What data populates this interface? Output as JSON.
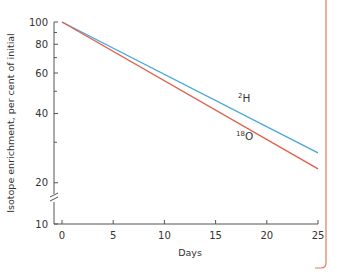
{
  "chart_data": {
    "type": "line",
    "title": "",
    "xlabel": "Days",
    "ylabel": "Isotope enrichment, per cent of initial",
    "x_scale": "linear",
    "y_scale": "log",
    "xlim": [
      0,
      25
    ],
    "ylim": [
      10,
      100
    ],
    "xticks": [
      0,
      5,
      10,
      15,
      20,
      25
    ],
    "yticks_labeled": [
      10,
      20,
      40,
      60,
      80,
      100
    ],
    "yticks_minor": [
      30,
      50,
      70,
      90
    ],
    "y_axis_break": "between 10 and 20",
    "grid": false,
    "legend": "inline labels",
    "series": [
      {
        "name": "²H",
        "label_main": "H",
        "label_sup": "2",
        "color": "#4aa8d8",
        "x": [
          0,
          25
        ],
        "values": [
          100,
          27
        ]
      },
      {
        "name": "¹⁸O",
        "label_main": "O",
        "label_sup": "18",
        "color": "#e0604a",
        "x": [
          0,
          25
        ],
        "values": [
          100,
          23
        ]
      }
    ]
  },
  "frame": {
    "border_color": "#e07a5f"
  }
}
